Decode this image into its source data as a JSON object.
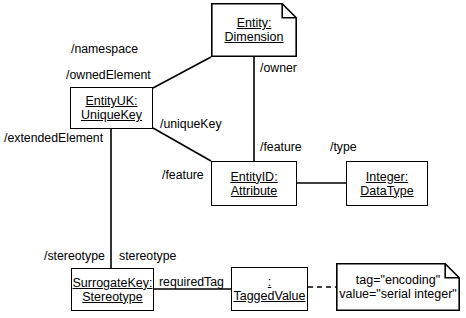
{
  "diagram": {
    "canvas": {
      "width": 466,
      "height": 318
    },
    "stroke_color": "#000000",
    "background_color": "#ffffff"
  },
  "nodes": [
    {
      "id": "entity-dimension",
      "shape": "note",
      "x": 211,
      "y": 3,
      "w": 86,
      "h": 54,
      "lines": [
        {
          "text": "Entity:",
          "underline": true
        },
        {
          "text": "Dimension",
          "underline": true
        }
      ]
    },
    {
      "id": "entity-uk",
      "shape": "rect",
      "x": 70,
      "y": 87,
      "w": 83,
      "h": 42,
      "lines": [
        {
          "text": "EntityUK:",
          "underline": true
        },
        {
          "text": "UniqueKey",
          "underline": true
        }
      ]
    },
    {
      "id": "entity-id",
      "shape": "rect",
      "x": 211,
      "y": 161,
      "w": 86,
      "h": 45,
      "lines": [
        {
          "text": "EntityID:",
          "underline": true
        },
        {
          "text": "Attribute",
          "underline": true
        }
      ]
    },
    {
      "id": "integer-datatype",
      "shape": "rect",
      "x": 346,
      "y": 161,
      "w": 82,
      "h": 45,
      "lines": [
        {
          "text": "Integer:",
          "underline": true
        },
        {
          "text": "DataType",
          "underline": true
        }
      ]
    },
    {
      "id": "surrogate-key",
      "shape": "rect",
      "x": 71,
      "y": 268,
      "w": 83,
      "h": 43,
      "lines": [
        {
          "text": "SurrogateKey:",
          "underline": true
        },
        {
          "text": "Stereotype",
          "underline": true
        }
      ]
    },
    {
      "id": "tagged-value",
      "shape": "rect",
      "x": 231,
      "y": 267,
      "w": 77,
      "h": 44,
      "lines": [
        {
          "text": ":",
          "underline": true
        },
        {
          "text": "TaggedValue",
          "underline": true
        }
      ]
    },
    {
      "id": "tag-note",
      "shape": "note",
      "x": 336,
      "y": 263,
      "w": 124,
      "h": 48,
      "lines": [
        {
          "text": "tag=\"encoding\"",
          "underline": false
        },
        {
          "text": "value=\"serial integer\"",
          "underline": false
        }
      ]
    }
  ],
  "edges": [
    {
      "id": "namespace-ownedelement",
      "from": "entity-uk",
      "to": "entity-dimension",
      "style": "solid",
      "points": [
        [
          153,
          88
        ],
        [
          211,
          57
        ]
      ]
    },
    {
      "id": "owner-feature",
      "from": "entity-dimension",
      "to": "entity-id",
      "style": "solid",
      "points": [
        [
          254,
          57
        ],
        [
          254,
          161
        ]
      ]
    },
    {
      "id": "uniquekey-feature",
      "from": "entity-uk",
      "to": "entity-id",
      "style": "solid",
      "points": [
        [
          153,
          128
        ],
        [
          211,
          161
        ]
      ]
    },
    {
      "id": "type-edge",
      "from": "entity-id",
      "to": "integer-datatype",
      "style": "solid",
      "points": [
        [
          297,
          183
        ],
        [
          346,
          183
        ]
      ]
    },
    {
      "id": "extendedelement-stereotype",
      "from": "entity-uk",
      "to": "surrogate-key",
      "style": "solid",
      "points": [
        [
          111,
          129
        ],
        [
          111,
          268
        ]
      ]
    },
    {
      "id": "requiredtag-edge",
      "from": "surrogate-key",
      "to": "tagged-value",
      "style": "solid",
      "points": [
        [
          154,
          289
        ],
        [
          231,
          289
        ]
      ]
    },
    {
      "id": "taggedvalue-note-anchor",
      "from": "tagged-value",
      "to": "tag-note",
      "style": "dashed",
      "points": [
        [
          308,
          287
        ],
        [
          336,
          287
        ]
      ]
    }
  ],
  "edge_labels": [
    {
      "id": "namespace-label",
      "text": "/namespace",
      "x": 138,
      "y": 42,
      "anchor": "end"
    },
    {
      "id": "owner-label",
      "text": "/owner",
      "x": 260,
      "y": 61,
      "anchor": "start"
    },
    {
      "id": "ownedelement-label",
      "text": "/ownedElement",
      "x": 66,
      "y": 68,
      "anchor": "start"
    },
    {
      "id": "uniquekey-label",
      "text": "/uniqueKey",
      "x": 160,
      "y": 117,
      "anchor": "start"
    },
    {
      "id": "extendedelement-label",
      "text": "/extendedElement",
      "x": 4,
      "y": 131,
      "anchor": "start"
    },
    {
      "id": "feature-upper-label",
      "text": "/feature",
      "x": 260,
      "y": 140,
      "anchor": "start"
    },
    {
      "id": "type-label",
      "text": "/type",
      "x": 330,
      "y": 140,
      "anchor": "start"
    },
    {
      "id": "feature-left-label",
      "text": "/feature",
      "x": 162,
      "y": 168,
      "anchor": "start"
    },
    {
      "id": "stereotype-slash-label",
      "text": "/stereotype",
      "x": 44,
      "y": 249,
      "anchor": "start"
    },
    {
      "id": "stereotype-label",
      "text": "stereotype",
      "x": 119,
      "y": 249,
      "anchor": "start"
    },
    {
      "id": "requiredtag-label",
      "text": "requiredTag",
      "x": 159,
      "y": 275,
      "anchor": "start"
    }
  ]
}
